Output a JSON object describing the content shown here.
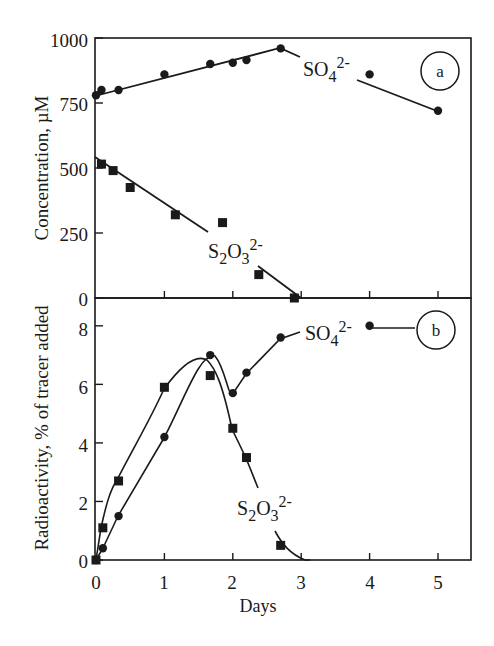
{
  "chart_data": [
    {
      "panel": "a",
      "type": "line",
      "xlabel": "Days",
      "ylabel": "Concentration, µM",
      "xlim": [
        0,
        5.5
      ],
      "ylim": [
        0,
        1000
      ],
      "yticks": [
        0,
        250,
        500,
        750,
        1000
      ],
      "xticks": [
        0,
        1,
        2,
        3,
        4,
        5
      ],
      "grid": false,
      "series": [
        {
          "name": "SO4 2-",
          "label_main": "SO",
          "label_sub": "4",
          "label_sup": "2-",
          "marker": "circle",
          "x": [
            0,
            0.08,
            0.33,
            1.0,
            1.67,
            2.0,
            2.2,
            2.7,
            4.0,
            5.0
          ],
          "y": [
            780,
            800,
            800,
            860,
            900,
            905,
            915,
            960,
            860,
            720
          ]
        },
        {
          "name": "S2O3 2-",
          "label_main": "S",
          "label_sub": "2",
          "label_main2": "O",
          "label_sub2": "3",
          "label_sup": "2-",
          "marker": "square",
          "x": [
            0.08,
            0.25,
            0.5,
            1.16,
            1.85,
            2.38,
            2.9
          ],
          "y": [
            515,
            490,
            425,
            320,
            290,
            90,
            0
          ]
        }
      ]
    },
    {
      "panel": "b",
      "type": "line",
      "xlabel": "Days",
      "ylabel": "Radioactivity, % of tracer added",
      "xlim": [
        0,
        5.5
      ],
      "ylim": [
        0,
        9
      ],
      "yticks": [
        0,
        2,
        4,
        6,
        8
      ],
      "xticks": [
        0,
        1,
        2,
        3,
        4,
        5
      ],
      "grid": false,
      "series": [
        {
          "name": "SO4 2-",
          "marker": "circle",
          "x": [
            0,
            0.1,
            0.33,
            1.0,
            1.67,
            2.0,
            2.2,
            2.7,
            4.0
          ],
          "y": [
            0,
            0.4,
            1.5,
            4.2,
            7.0,
            5.7,
            6.4,
            7.6,
            8.0
          ]
        },
        {
          "name": "S2O3 2-",
          "marker": "square",
          "x": [
            0,
            0.1,
            0.33,
            1.0,
            1.67,
            2.0,
            2.2,
            2.7
          ],
          "y": [
            0,
            1.1,
            2.7,
            5.9,
            6.3,
            4.5,
            3.5,
            0.5
          ]
        }
      ]
    }
  ],
  "figure": {
    "panel_a_label": "a",
    "panel_b_label": "b",
    "xlabel": "Days",
    "ylabel_top": "Concentration, µM",
    "ylabel_bottom": "Radioactivity, % of tracer added",
    "x_tick_labels": [
      "0",
      "1",
      "2",
      "3",
      "4",
      "5"
    ],
    "y_tick_labels_top": [
      "0",
      "250",
      "500",
      "750",
      "1000"
    ],
    "y_tick_labels_bottom": [
      "0",
      "2",
      "4",
      "6",
      "8"
    ],
    "so4_label": {
      "main": "SO",
      "sub": "4",
      "sup": "2-"
    },
    "s2o3_label": {
      "s": "S",
      "sub1": "2",
      "o": "O",
      "sub2": "3",
      "sup": "2-"
    }
  }
}
